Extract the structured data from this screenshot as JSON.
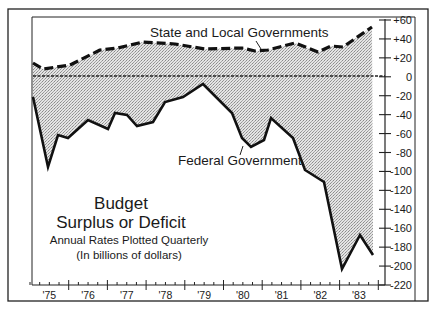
{
  "chart_data": {
    "type": "line",
    "title": "Budget Surplus or Deficit",
    "title_lines": [
      "Budget",
      "Surplus or Deficit"
    ],
    "subtitle_lines": [
      "Annual Rates Plotted Quarterly",
      "(In billions of dollars)"
    ],
    "xlabel": "",
    "ylabel": "",
    "ylim": [
      -220,
      60
    ],
    "xlim": [
      1975,
      1984
    ],
    "y_axis_position": "right",
    "y_ticks": [
      60,
      40,
      20,
      0,
      -20,
      -40,
      -60,
      -80,
      -100,
      -120,
      -140,
      -160,
      -180,
      -200,
      -220
    ],
    "y_tick_labels": [
      "+60",
      "+40",
      "+20",
      "0",
      "-20",
      "-40",
      "-60",
      "-80",
      "-100",
      "-120",
      "-140",
      "-160",
      "-180",
      "-200",
      "-220"
    ],
    "x_tick_labels": [
      "'75",
      "'76",
      "'77",
      "'78",
      "'79",
      "'80",
      "'81",
      "'82",
      "'83"
    ],
    "grid": false,
    "legend": "inline annotations",
    "fill": "stippled gray area between the two series",
    "series": [
      {
        "name": "State and Local Governments",
        "style": "heavy dashed",
        "x": [
          1975.05,
          1975.3,
          1976.0,
          1976.75,
          1977.25,
          1977.85,
          1978.7,
          1979.45,
          1980.4,
          1980.7,
          1981.05,
          1981.7,
          1982.3,
          1982.65,
          1182.95,
          1983.7
        ],
        "values": [
          15,
          8,
          13,
          28,
          30,
          37,
          35,
          30,
          31,
          27,
          28,
          36,
          26,
          33,
          32,
          53
        ]
      },
      {
        "name": "Federal Government",
        "style": "heavy solid",
        "x": [
          1975.05,
          1975.45,
          1975.7,
          1976.0,
          1976.5,
          1977.0,
          1977.2,
          1977.5,
          1977.75,
          1978.15,
          1978.45,
          1978.95,
          1979.45,
          1980.2,
          1980.45,
          1980.7,
          1981.0,
          1981.2,
          1981.75,
          1982.05,
          1982.55,
          1183.0,
          1983.45,
          1983.8
        ],
        "values": [
          -21,
          -95,
          -61,
          -64,
          -45,
          -55,
          -38,
          -40,
          -52,
          -48,
          -26,
          -21,
          -7,
          -38,
          -64,
          -74,
          -66,
          -43,
          -64,
          -98,
          -111,
          -203,
          -167,
          -188
        ]
      }
    ],
    "annotations": [
      {
        "text": "State and Local Governments",
        "points_to": "State and Local Governments series"
      },
      {
        "text": "Federal Government",
        "points_to": "Federal Government series"
      }
    ]
  },
  "labels": {
    "state_local": "State and Local Governments",
    "federal": "Federal Government",
    "title_line1": "Budget",
    "title_line2": "Surplus or Deficit",
    "subtitle_line1": "Annual Rates Plotted Quarterly",
    "subtitle_line2": "(In billions of dollars)"
  },
  "layout": {
    "plot_left": 32,
    "plot_right": 385,
    "plot_top": 17,
    "plot_bottom": 285,
    "year_start_x": 30,
    "year_width": 38.7,
    "series_pixels": {
      "state": [
        [
          33,
          63
        ],
        [
          43,
          69
        ],
        [
          70,
          65
        ],
        [
          100,
          50
        ],
        [
          118,
          48
        ],
        [
          143,
          42
        ],
        [
          175,
          44
        ],
        [
          205,
          49
        ],
        [
          242,
          48
        ],
        [
          255,
          51
        ],
        [
          268,
          50
        ],
        [
          295,
          43
        ],
        [
          318,
          52
        ],
        [
          331,
          46
        ],
        [
          343,
          47
        ],
        [
          372,
          27
        ]
      ],
      "federal": [
        [
          33,
          97
        ],
        [
          48,
          167
        ],
        [
          58,
          135
        ],
        [
          68,
          138
        ],
        [
          88,
          120
        ],
        [
          108,
          129
        ],
        [
          115,
          113
        ],
        [
          127,
          115
        ],
        [
          137,
          126
        ],
        [
          153,
          122
        ],
        [
          165,
          102
        ],
        [
          183,
          97
        ],
        [
          203,
          84
        ],
        [
          232,
          113
        ],
        [
          242,
          138
        ],
        [
          251,
          147
        ],
        [
          264,
          140
        ],
        [
          271,
          118
        ],
        [
          293,
          138
        ],
        [
          305,
          170
        ],
        [
          324,
          182
        ],
        [
          342,
          269
        ],
        [
          360,
          235
        ],
        [
          373,
          255
        ]
      ]
    }
  }
}
